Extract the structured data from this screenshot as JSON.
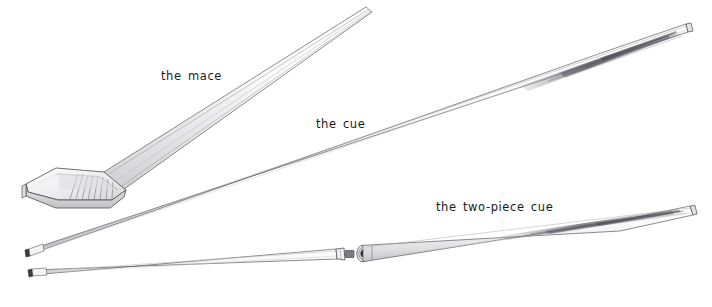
{
  "figure": {
    "background_color": "#ffffff",
    "ink_color": "#3a3a3a",
    "width": 712,
    "height": 307,
    "labels": {
      "mace": "the mace",
      "cue": "the cue",
      "two_piece_cue": "the two-piece cue"
    },
    "objects": [
      {
        "name": "mace",
        "label": "the mace",
        "description": "antique billiard mace with flat wedge-shaped head and long tapering shaft",
        "head_end": [
          22,
          205
        ],
        "tip_end": [
          370,
          8
        ]
      },
      {
        "name": "cue",
        "label": "the cue",
        "description": "one-piece billiard cue with leather tip and tapered spliced butt",
        "tip_end": [
          27,
          252
        ],
        "butt_end": [
          688,
          28
        ]
      },
      {
        "name": "two-piece-cue",
        "label": "the two-piece cue",
        "description": "two-piece billiard cue shown separated at the threaded screw joint",
        "tip_end": [
          30,
          272
        ],
        "butt_end": [
          697,
          212
        ],
        "joint_pin_x": 350,
        "joint_socket_x": 363
      }
    ]
  }
}
